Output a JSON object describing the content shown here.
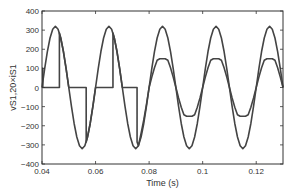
{
  "chart_data": {
    "type": "line",
    "title": "",
    "xlabel": "Time (s)",
    "ylabel": "vS1,20×iS1",
    "xlim": [
      0.04,
      0.13
    ],
    "ylim": [
      -400,
      400
    ],
    "grid": false,
    "legend": null,
    "x_ticks": [
      "0.04",
      "0.06",
      "0.08",
      "0.1",
      "0.12"
    ],
    "x_tick_values": [
      0.04,
      0.06,
      0.08,
      0.1,
      0.12
    ],
    "y_ticks": [
      "400",
      "300",
      "200",
      "100",
      "0",
      "−100",
      "−200",
      "−300",
      "−400"
    ],
    "y_tick_values": [
      400,
      300,
      200,
      100,
      0,
      -100,
      -200,
      -300,
      -400
    ],
    "line_color": "#444444",
    "series": [
      {
        "name": "vS1",
        "description": "Source voltage, sinusoid amplitude ~320 V, 50 Hz",
        "amplitude": 320,
        "frequency_hz": 50,
        "x": [
          0.04,
          0.041,
          0.042,
          0.043,
          0.044,
          0.045,
          0.046,
          0.047,
          0.048,
          0.049,
          0.05,
          0.051,
          0.052,
          0.053,
          0.054,
          0.055,
          0.056,
          0.057,
          0.058,
          0.059,
          0.06,
          0.061,
          0.062,
          0.063,
          0.064,
          0.065,
          0.066,
          0.067,
          0.068,
          0.069,
          0.07,
          0.071,
          0.072,
          0.073,
          0.074,
          0.075,
          0.076,
          0.077,
          0.078,
          0.079,
          0.08,
          0.081,
          0.082,
          0.083,
          0.084,
          0.085,
          0.086,
          0.087,
          0.088,
          0.089,
          0.09,
          0.091,
          0.092,
          0.093,
          0.094,
          0.095,
          0.096,
          0.097,
          0.098,
          0.099,
          0.1,
          0.101,
          0.102,
          0.103,
          0.104,
          0.105,
          0.106,
          0.107,
          0.108,
          0.109,
          0.11,
          0.111,
          0.112,
          0.113,
          0.114,
          0.115,
          0.116,
          0.117,
          0.118,
          0.119,
          0.12,
          0.121,
          0.122,
          0.123,
          0.124,
          0.125,
          0.126,
          0.127,
          0.128,
          0.129,
          0.13
        ],
        "values": [
          0,
          98.9,
          188.1,
          258.9,
          304.3,
          320,
          304.3,
          258.9,
          188.1,
          98.9,
          0,
          -98.9,
          -188.1,
          -258.9,
          -304.3,
          -320,
          -304.3,
          -258.9,
          -188.1,
          -98.9,
          0,
          98.9,
          188.1,
          258.9,
          304.3,
          320,
          304.3,
          258.9,
          188.1,
          98.9,
          0,
          -98.9,
          -188.1,
          -258.9,
          -304.3,
          -320,
          -304.3,
          -258.9,
          -188.1,
          -98.9,
          0,
          98.9,
          188.1,
          258.9,
          304.3,
          320,
          304.3,
          258.9,
          188.1,
          98.9,
          0,
          -98.9,
          -188.1,
          -258.9,
          -304.3,
          -320,
          -304.3,
          -258.9,
          -188.1,
          -98.9,
          0,
          98.9,
          188.1,
          258.9,
          304.3,
          320,
          304.3,
          258.9,
          188.1,
          98.9,
          0,
          -98.9,
          -188.1,
          -258.9,
          -304.3,
          -320,
          -304.3,
          -258.9,
          -188.1,
          -98.9,
          0,
          98.9,
          188.1,
          258.9,
          304.3,
          320,
          304.3,
          258.9,
          188.1,
          98.9,
          0
        ]
      },
      {
        "name": "20×iS1",
        "description": "Scaled switch current: phase-controlled chopped sine before ~0.0775 s, then flattened sine (±150) in phase with voltage",
        "x": [
          0.04,
          0.0403,
          0.0403,
          0.0465,
          0.0465,
          0.047,
          0.048,
          0.049,
          0.05,
          0.0565,
          0.0565,
          0.057,
          0.058,
          0.059,
          0.06,
          0.0665,
          0.0665,
          0.067,
          0.068,
          0.069,
          0.07,
          0.0755,
          0.0755,
          0.076,
          0.077,
          0.078,
          0.079,
          0.08,
          0.081,
          0.082,
          0.083,
          0.084,
          0.085,
          0.086,
          0.087,
          0.088,
          0.089,
          0.09,
          0.091,
          0.092,
          0.093,
          0.094,
          0.095,
          0.096,
          0.097,
          0.098,
          0.099,
          0.1,
          0.101,
          0.102,
          0.103,
          0.104,
          0.105,
          0.106,
          0.107,
          0.108,
          0.109,
          0.11,
          0.111,
          0.112,
          0.113,
          0.114,
          0.115,
          0.116,
          0.117,
          0.118,
          0.119,
          0.12,
          0.121,
          0.122,
          0.123,
          0.124,
          0.125,
          0.126,
          0.127,
          0.128,
          0.129,
          0.13
        ],
        "values": [
          100,
          100,
          0,
          0,
          285,
          258.9,
          188.1,
          98.9,
          0,
          0,
          -285,
          -258.9,
          -188.1,
          -98.9,
          0,
          0,
          285,
          258.9,
          188.1,
          98.9,
          0,
          0,
          -285,
          -304.3,
          -240,
          -170,
          -90,
          0,
          54.4,
          103.5,
          142.4,
          150,
          150,
          150,
          142.4,
          103.5,
          54.4,
          0,
          -54.4,
          -103.5,
          -142.4,
          -150,
          -150,
          -150,
          -142.4,
          -103.5,
          -54.4,
          0,
          54.4,
          103.5,
          142.4,
          150,
          150,
          150,
          142.4,
          103.5,
          54.4,
          0,
          -54.4,
          -103.5,
          -142.4,
          -150,
          -150,
          -150,
          -142.4,
          -103.5,
          -54.4,
          0,
          54.4,
          103.5,
          142.4,
          150,
          150,
          150,
          142.4,
          103.5,
          54.4,
          0
        ]
      }
    ]
  }
}
